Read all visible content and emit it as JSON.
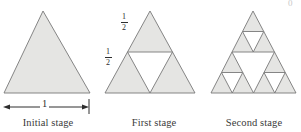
{
  "figure": {
    "colors": {
      "fill": "#e5e5e3",
      "stroke": "#787878",
      "text": "#2e2e2e",
      "background": "#ffffff"
    }
  },
  "stages": [
    {
      "id": "initial",
      "caption": "Initial stage",
      "depth": 0,
      "apex": {
        "x": 43,
        "y": 11
      },
      "left": {
        "x": 4,
        "y": 93
      },
      "right": {
        "x": 90,
        "y": 93
      }
    },
    {
      "id": "first",
      "caption": "First stage",
      "depth": 1,
      "apex": {
        "x": 150,
        "y": 11
      },
      "left": {
        "x": 105,
        "y": 93
      },
      "right": {
        "x": 195,
        "y": 93
      }
    },
    {
      "id": "second",
      "caption": "Second stage",
      "depth": 2,
      "apex": {
        "x": 253,
        "y": 11
      },
      "left": {
        "x": 211,
        "y": 93
      },
      "right": {
        "x": 296,
        "y": 93
      }
    }
  ],
  "dimension": {
    "label": "1",
    "line_y": 107,
    "x_start": 3,
    "x_end": 89,
    "tick_x": 89,
    "tick_top": 99,
    "tick_bottom": 114
  },
  "fractions": {
    "upper_edge": {
      "numerator": "1",
      "denominator": "2"
    },
    "left_edge": {
      "numerator": "1",
      "denominator": "2"
    }
  },
  "artifacts": {
    "top_right_partial_glyph": "0"
  }
}
